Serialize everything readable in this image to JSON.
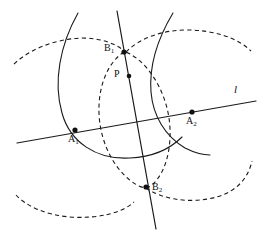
{
  "figure": {
    "background_color": "#ffffff",
    "stroke_color": "#1a1a1a",
    "width": 263,
    "height": 235,
    "points": [
      {
        "id": "A1",
        "label": "A",
        "subscript": "1",
        "x": 75,
        "y": 130,
        "label_x": 68,
        "label_y": 134
      },
      {
        "id": "A2",
        "label": "A",
        "subscript": "2",
        "x": 192,
        "y": 112,
        "label_x": 186,
        "label_y": 116
      },
      {
        "id": "B1",
        "label": "B",
        "subscript": "1",
        "x": 124,
        "y": 52,
        "label_x": 104,
        "label_y": 43
      },
      {
        "id": "P",
        "label": "P",
        "subscript": "",
        "x": 129,
        "y": 76,
        "label_x": 114,
        "label_y": 69
      },
      {
        "id": "B2",
        "label": "B",
        "subscript": "2",
        "x": 146,
        "y": 187,
        "label_x": 152,
        "label_y": 182
      }
    ],
    "lines": [
      {
        "id": "line-l",
        "name": "line-l",
        "label": "l",
        "label_x": 234,
        "label_y": 84,
        "x1": 17,
        "y1": 143,
        "x2": 256,
        "y2": 101,
        "style": "solid"
      },
      {
        "id": "line-perpendicular",
        "name": "perpendicular-bisector-line",
        "label": "",
        "label_x": 0,
        "label_y": 0,
        "x1": 117,
        "y1": 11,
        "x2": 156,
        "y2": 229,
        "style": "solid"
      }
    ],
    "arcs": [
      {
        "id": "arc-solid-left",
        "name": "solid-arc-centered-A1",
        "style": "solid",
        "path": "M 78 13 C 60 45 53 82 62 113 C 70 142 96 160 130 158 C 152 157 170 149 182 137"
      },
      {
        "id": "arc-solid-right",
        "name": "solid-arc-centered-A2",
        "style": "solid",
        "path": "M 173 13 C 158 38 149 66 151 92 C 153 116 165 136 185 148 C 195 153 203 155 210 155"
      },
      {
        "id": "arc-dashed-oval",
        "name": "dashed-circle-through-B1-B2",
        "style": "dashed",
        "path": "M 124 52 C 108 62 98 86 99 113 C 100 145 117 175 139 186 C 143 188 146 188 149 187 C 163 178 171 155 170 129 C 169 98 152 66 130 54 C 128 53 126 52 124 52 Z"
      },
      {
        "id": "arc-dashed-upper-left",
        "name": "dashed-arc-upper-left",
        "style": "dashed",
        "path": "M 14 64 C 30 49 55 39 82 38 C 100 38 115 43 126 52"
      },
      {
        "id": "arc-dashed-upper-right",
        "name": "dashed-arc-upper-right",
        "style": "dashed",
        "path": "M 126 52 C 140 38 162 30 187 30 C 214 30 238 38 251 51"
      },
      {
        "id": "arc-dashed-lower-left",
        "name": "dashed-arc-lower-left",
        "style": "dashed",
        "path": "M 16 195 C 26 206 46 215 70 217 C 98 219 122 213 134 202"
      },
      {
        "id": "arc-dashed-lower-right",
        "name": "dashed-arc-lower-right",
        "style": "dashed",
        "path": "M 146 188 C 160 198 184 203 208 199 C 231 195 247 183 252 161"
      }
    ]
  }
}
